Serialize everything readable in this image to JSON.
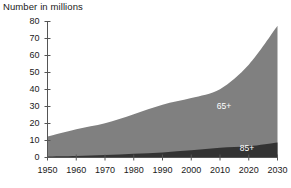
{
  "chart_data": {
    "type": "area",
    "title": "Number in millions",
    "xlabel": "",
    "ylabel": "",
    "stacked": true,
    "grid": false,
    "legend_position": "inline-annotation",
    "x": [
      1950,
      1960,
      1970,
      1980,
      1990,
      2000,
      2010,
      2020,
      2030
    ],
    "xlim": [
      1950,
      2030
    ],
    "ylim": [
      0,
      80
    ],
    "xticks": [
      "1950",
      "1960",
      "1970",
      "1980",
      "1990",
      "2000",
      "2010",
      "2020",
      "2030"
    ],
    "yticks": [
      "0",
      "10",
      "20",
      "30",
      "40",
      "50",
      "60",
      "70",
      "80"
    ],
    "series": [
      {
        "name": "85+",
        "color": "#333333",
        "values": [
          0.6,
          0.9,
          1.4,
          2.2,
          3.0,
          4.2,
          5.8,
          6.6,
          8.8
        ]
      },
      {
        "name": "65+",
        "color": "#808080",
        "values": [
          12.3,
          16.6,
          20.1,
          25.5,
          31.1,
          35.0,
          40.2,
          54.6,
          77.5
        ]
      }
    ],
    "annotations": [
      {
        "text": "65+",
        "x": 2012,
        "y": 30
      },
      {
        "text": "85+",
        "x": 2020,
        "y": 5
      }
    ]
  },
  "axis": {
    "line_color": "#555555",
    "tick_color": "#555555"
  }
}
